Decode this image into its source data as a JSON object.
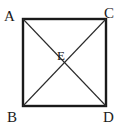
{
  "figure": {
    "type": "geometry-diagram",
    "shape": "square",
    "background_color": "#ffffff",
    "stroke_color": "#1a1a1a",
    "outline_width_px": 2,
    "diagonal_width_px": 1,
    "square": {
      "left": 22,
      "top": 18,
      "right": 107,
      "bottom": 107
    },
    "vertices": [
      {
        "id": "A",
        "label": "A",
        "position": "top-left"
      },
      {
        "id": "C",
        "label": "C",
        "position": "top-right"
      },
      {
        "id": "B",
        "label": "B",
        "position": "bottom-left"
      },
      {
        "id": "D",
        "label": "D",
        "position": "bottom-right"
      }
    ],
    "center_point": {
      "id": "E",
      "label": "E",
      "x": 64,
      "y": 62
    },
    "diagonals": [
      {
        "from": "A",
        "to": "D"
      },
      {
        "from": "C",
        "to": "B"
      }
    ]
  }
}
